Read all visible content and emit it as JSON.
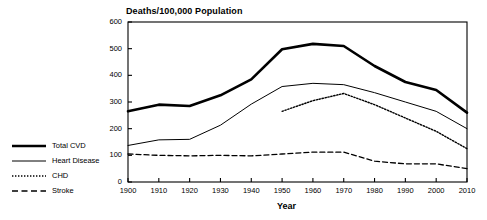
{
  "chart_data": {
    "type": "line",
    "title": "Deaths/100,000 Population",
    "xlabel": "Year",
    "ylabel": "",
    "x": [
      1900,
      1910,
      1920,
      1930,
      1940,
      1950,
      1960,
      1970,
      1980,
      1990,
      2000,
      2010
    ],
    "xlim": [
      1900,
      2010
    ],
    "ylim": [
      0,
      600
    ],
    "xticks": [
      "1900",
      "1910",
      "1920",
      "1930",
      "1940",
      "1950",
      "1960",
      "1970",
      "1980",
      "1990",
      "2000",
      "2010"
    ],
    "yticks": [
      "0",
      "100",
      "200",
      "300",
      "400",
      "500",
      "600"
    ],
    "grid": false,
    "legend_position": "left-outside",
    "series": [
      {
        "name": "Total CVD",
        "style": "solid-thick",
        "x": [
          1900,
          1910,
          1920,
          1930,
          1940,
          1950,
          1960,
          1970,
          1980,
          1990,
          2000,
          2010
        ],
        "values": [
          265,
          290,
          285,
          325,
          385,
          498,
          518,
          510,
          435,
          375,
          345,
          260
        ]
      },
      {
        "name": "Heart Disease",
        "style": "solid-thin",
        "x": [
          1900,
          1910,
          1920,
          1930,
          1940,
          1950,
          1960,
          1970,
          1980,
          1990,
          2000,
          2010
        ],
        "values": [
          137,
          158,
          160,
          213,
          292,
          358,
          370,
          365,
          335,
          300,
          265,
          200
        ]
      },
      {
        "name": "CHD",
        "style": "dotted",
        "x": [
          1950,
          1960,
          1970,
          1980,
          1990,
          2000,
          2010
        ],
        "values": [
          265,
          305,
          332,
          290,
          240,
          190,
          125
        ]
      },
      {
        "name": "Stroke",
        "style": "dashed",
        "x": [
          1900,
          1910,
          1920,
          1930,
          1940,
          1950,
          1960,
          1970,
          1980,
          1990,
          2000,
          2010
        ],
        "values": [
          105,
          100,
          98,
          100,
          98,
          105,
          112,
          112,
          78,
          68,
          68,
          50
        ]
      }
    ]
  },
  "legend": {
    "items": [
      {
        "label": "Total CVD"
      },
      {
        "label": "Heart Disease"
      },
      {
        "label": "CHD"
      },
      {
        "label": "Stroke"
      }
    ]
  },
  "colors": {
    "ink": "#000000",
    "background": "#ffffff"
  }
}
